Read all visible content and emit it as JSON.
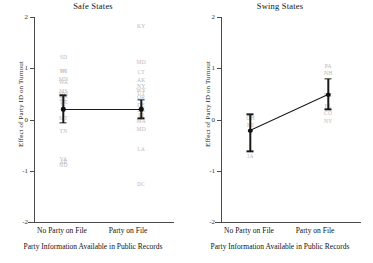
{
  "figure": {
    "xlabel": "Party Information Available in Public Records",
    "ylabel": "Effect of Party ID on Turnout",
    "categories": [
      "No Party on File",
      "Party on File"
    ],
    "y_ticks": [
      "2",
      "1",
      "0",
      "-1",
      "-2"
    ]
  },
  "chart_data": [
    {
      "type": "line",
      "title": "Safe States",
      "xlabel": "Party Information Available in Public Records",
      "ylabel": "Effect of Party ID on Turnout",
      "categories": [
        "No Party on File",
        "Party on File"
      ],
      "ylim": [
        -2,
        2
      ],
      "yticks": [
        2,
        1,
        0,
        -1,
        -2
      ],
      "grid": false,
      "legend": "none",
      "series": [
        {
          "name": "Safe States mean effect",
          "values": [
            0.2,
            0.2
          ],
          "ci_low": [
            -0.07,
            0.02
          ],
          "ci_high": [
            0.47,
            0.38
          ]
        }
      ],
      "state_points": [
        {
          "label": "SD",
          "x": 0,
          "y": 1.22
        },
        {
          "label": "WI",
          "x": 0,
          "y": 0.95
        },
        {
          "label": "IN",
          "x": 0,
          "y": 0.95
        },
        {
          "label": "MN",
          "x": 0,
          "y": 0.8
        },
        {
          "label": "WA",
          "x": 0,
          "y": 0.73
        },
        {
          "label": "MS",
          "x": 0,
          "y": 0.55
        },
        {
          "label": "MO",
          "x": 0,
          "y": 0.5
        },
        {
          "label": "GA",
          "x": 0,
          "y": 0.45
        },
        {
          "label": "AL",
          "x": 0,
          "y": 0.4
        },
        {
          "label": "TX",
          "x": 0,
          "y": 0.35
        },
        {
          "label": "IL",
          "x": 0,
          "y": 0.3
        },
        {
          "label": "MT",
          "x": 0,
          "y": 0.03
        },
        {
          "label": "TN",
          "x": 0,
          "y": -0.23
        },
        {
          "label": "VA",
          "x": 0,
          "y": -0.78
        },
        {
          "label": "AR",
          "x": 0,
          "y": -0.83
        },
        {
          "label": "ND",
          "x": 0,
          "y": -0.88
        },
        {
          "label": "KY",
          "x": 1,
          "y": 1.82
        },
        {
          "label": "MD",
          "x": 1,
          "y": 1.12
        },
        {
          "label": "CT",
          "x": 1,
          "y": 0.92
        },
        {
          "label": "AK",
          "x": 1,
          "y": 0.78
        },
        {
          "label": "NY",
          "x": 1,
          "y": 0.66
        },
        {
          "label": "WY",
          "x": 1,
          "y": 0.58
        },
        {
          "label": "UT",
          "x": 1,
          "y": 0.52
        },
        {
          "label": "OR",
          "x": 1,
          "y": 0.44
        },
        {
          "label": "DE",
          "x": 1,
          "y": 0.28
        },
        {
          "label": "KS",
          "x": 1,
          "y": 0.18
        },
        {
          "label": "RI",
          "x": 1,
          "y": 0.08
        },
        {
          "label": "MA",
          "x": 1,
          "y": -0.03
        },
        {
          "label": "MD",
          "x": 1,
          "y": -0.18
        },
        {
          "label": "LA",
          "x": 1,
          "y": -0.57
        },
        {
          "label": "DC",
          "x": 1,
          "y": -1.25
        }
      ]
    },
    {
      "type": "line",
      "title": "Swing States",
      "xlabel": "Party Information Available in Public Records",
      "ylabel": "Effect of Party ID on Turnout",
      "categories": [
        "No Party on File",
        "Party on File"
      ],
      "ylim": [
        -2,
        2
      ],
      "yticks": [
        2,
        1,
        0,
        -1,
        -2
      ],
      "grid": false,
      "legend": "none",
      "series": [
        {
          "name": "Swing States mean effect",
          "values": [
            -0.22,
            0.48
          ],
          "ci_low": [
            -0.62,
            0.2
          ],
          "ci_high": [
            0.1,
            0.8
          ]
        }
      ],
      "state_points": [
        {
          "label": "OH",
          "x": 0,
          "y": 0.02
        },
        {
          "label": "MI",
          "x": 0,
          "y": -0.1
        },
        {
          "label": "IA",
          "x": 0,
          "y": -0.72
        },
        {
          "label": "PA",
          "x": 1,
          "y": 1.05
        },
        {
          "label": "NH",
          "x": 1,
          "y": 0.9
        },
        {
          "label": "NC",
          "x": 1,
          "y": 0.48
        },
        {
          "label": "FL",
          "x": 1,
          "y": 0.26
        },
        {
          "label": "CO",
          "x": 1,
          "y": 0.12
        },
        {
          "label": "NV",
          "x": 1,
          "y": -0.02
        }
      ]
    }
  ]
}
